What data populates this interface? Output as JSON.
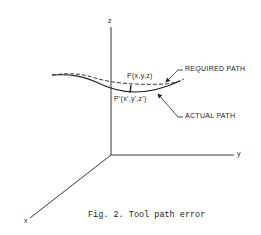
{
  "figure": {
    "caption": "Fig. 2.  Tool path error",
    "axes": {
      "x_label": "x",
      "y_label": "y",
      "z_label": "z"
    },
    "points": {
      "required_point": "P(x,y,z)",
      "actual_point": "P'(x',y',z')"
    },
    "callouts": {
      "required_path": "REQUIRED PATH",
      "actual_path": "ACTUAL PATH"
    },
    "colors": {
      "ink": "#222222",
      "background": "#ffffff"
    }
  }
}
